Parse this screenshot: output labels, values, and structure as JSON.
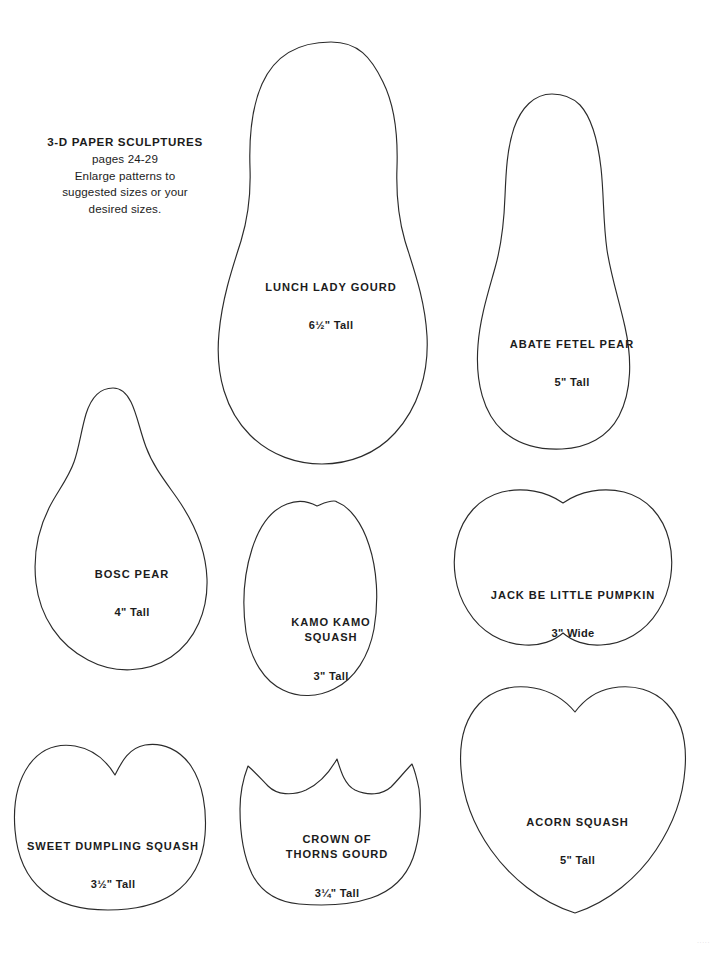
{
  "page": {
    "background_color": "#ffffff",
    "outline_color": "#2b2b2b",
    "text_color": "#1c1c1c",
    "corner_mark": "·····"
  },
  "instructions": {
    "headline": "3-D PAPER SCULPTURES",
    "body": "pages 24-29\nEnlarge patterns to\nsuggested sizes or your\ndesired sizes."
  },
  "patterns": [
    {
      "id": "lunch-lady-gourd",
      "name": "LUNCH LADY GOURD",
      "size": "6½\" Tall"
    },
    {
      "id": "abate-fetel-pear",
      "name": "ABATE FETEL PEAR",
      "size": "5\" Tall"
    },
    {
      "id": "bosc-pear",
      "name": "BOSC PEAR",
      "size": "4\" Tall"
    },
    {
      "id": "kamo-kamo-squash",
      "name": "KAMO KAMO\nSQUASH",
      "size": "3\" Tall"
    },
    {
      "id": "jack-be-little-pumpkin",
      "name": "JACK BE LITTLE PUMPKIN",
      "size": "3\" Wide"
    },
    {
      "id": "sweet-dumpling-squash",
      "name": "SWEET DUMPLING SQUASH",
      "size": "3½\" Tall"
    },
    {
      "id": "crown-of-thorns-gourd",
      "name": "CROWN OF\nTHORNS GOURD",
      "size": "3¼\" Tall"
    },
    {
      "id": "acorn-squash",
      "name": "ACORN SQUASH",
      "size": "5\" Tall"
    }
  ]
}
